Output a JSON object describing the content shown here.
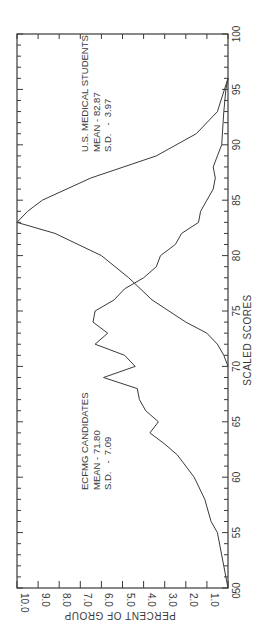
{
  "chart_data": {
    "type": "line",
    "orientation": "rotated 90 degrees counter-clockwise",
    "title": "",
    "xlabel": "SCALED SCORES",
    "ylabel": "PERCENT OF GROUP",
    "xlim": [
      50,
      100
    ],
    "ylim": [
      0,
      10.0
    ],
    "x_ticks": [
      "50",
      "55",
      "60",
      "65",
      "70",
      "75",
      "80",
      "85",
      "90",
      "95",
      "100"
    ],
    "y_ticks": [
      "0",
      "1.0",
      "2.0",
      "3.0",
      "4.0",
      "5.0",
      "6.0",
      "7.0",
      "8.0",
      "9.0",
      "10.0"
    ],
    "grid": false,
    "legend": "none (inline annotations)",
    "series": [
      {
        "name": "ECFMG CANDIDATES",
        "annotation": [
          "ECFMG CANDIDATES",
          "MEAN - 71.80",
          "S.D.   -  7.09"
        ],
        "mean": 71.8,
        "sd": 7.09,
        "x": [
          50,
          55,
          56,
          58,
          60,
          62,
          63,
          64,
          65,
          66,
          67,
          68,
          69,
          70,
          71,
          72,
          73,
          74,
          75,
          76,
          77,
          78,
          79,
          80,
          81,
          82,
          83,
          84,
          85,
          86,
          87,
          88,
          89,
          90,
          93,
          95,
          96
        ],
        "values": [
          0,
          0.5,
          0.8,
          1.1,
          1.6,
          2.4,
          3.0,
          3.7,
          3.3,
          3.9,
          4.2,
          4.3,
          5.9,
          4.4,
          4.9,
          6.3,
          5.7,
          6.4,
          6.3,
          5.4,
          4.9,
          4.0,
          3.4,
          3.2,
          2.5,
          2.2,
          1.4,
          1.3,
          1.0,
          0.7,
          0.6,
          0.7,
          0.5,
          0.3,
          0.2,
          0.1,
          0
        ]
      },
      {
        "name": "U.S. MEDICAL STUDENTS",
        "annotation": [
          "U.S. MEDICAL STUDENTS",
          "MEAN - 82.87",
          "S.D.   -  3.97"
        ],
        "mean": 82.87,
        "sd": 3.97,
        "x": [
          70,
          71,
          72,
          73,
          74,
          76,
          78,
          80,
          82,
          83,
          84,
          85,
          87,
          89,
          91,
          93,
          96
        ],
        "values": [
          0,
          0.2,
          0.5,
          1.0,
          2.0,
          3.6,
          4.7,
          6.0,
          8.2,
          10.0,
          9.5,
          8.8,
          6.5,
          3.4,
          1.5,
          0.5,
          0
        ]
      }
    ]
  },
  "labels": {
    "xlabel": "SCALED SCORES",
    "ylabel": "PERCENT OF GROUP",
    "ecfmg": {
      "title": "ECFMG CANDIDATES",
      "mean": "MEAN - 71.80",
      "sd": "S.D.   -  7.09"
    },
    "us": {
      "title": "U.S. MEDICAL STUDENTS",
      "mean": "MEAN - 82.87",
      "sd": "S.D.   -  3.97"
    }
  }
}
